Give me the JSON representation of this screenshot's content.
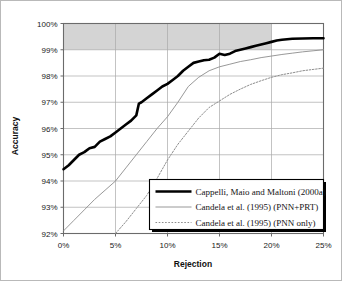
{
  "chart_data": {
    "type": "line",
    "title": "",
    "xlabel": "Rejection",
    "ylabel": "Accuracy",
    "xlim": [
      0,
      25
    ],
    "ylim": [
      92,
      100
    ],
    "grid": true,
    "legend_position": "bottom-right",
    "xticks": [
      "0%",
      "5%",
      "10%",
      "15%",
      "20%",
      "25%"
    ],
    "xtick_values": [
      0,
      5,
      10,
      15,
      20,
      25
    ],
    "yticks": [
      "92%",
      "93%",
      "94%",
      "95%",
      "96%",
      "97%",
      "98%",
      "99%",
      "100%"
    ],
    "ytick_values": [
      92,
      93,
      94,
      95,
      96,
      97,
      98,
      99,
      100
    ],
    "shaded_band": {
      "y_from": 99,
      "y_to": 100,
      "x_from": 0,
      "x_to": 20,
      "color": "#d4d4d4"
    },
    "series": [
      {
        "name": "Cappelli, Maio and Maltoni (2000a)",
        "style": "thick-solid",
        "color": "#000000",
        "x": [
          0,
          0.5,
          1,
          1.5,
          2,
          2.5,
          3,
          3.5,
          4,
          4.5,
          5,
          5.5,
          6,
          6.5,
          7,
          7.25,
          7.5,
          8,
          8.5,
          9,
          9.5,
          10,
          10.5,
          11,
          11.5,
          12,
          12.5,
          13,
          13.5,
          14,
          14.5,
          15,
          15.5,
          16,
          16.5,
          17,
          17.5,
          18,
          18.5,
          19,
          19.5,
          20,
          20.5,
          21,
          21.5,
          22,
          23,
          24,
          25
        ],
        "y": [
          94.45,
          94.6,
          94.8,
          95.0,
          95.1,
          95.25,
          95.3,
          95.5,
          95.6,
          95.7,
          95.85,
          96.0,
          96.15,
          96.3,
          96.5,
          96.95,
          97.0,
          97.15,
          97.3,
          97.45,
          97.6,
          97.7,
          97.85,
          98.0,
          98.2,
          98.35,
          98.5,
          98.55,
          98.6,
          98.62,
          98.7,
          98.85,
          98.8,
          98.85,
          98.95,
          99.0,
          99.05,
          99.1,
          99.15,
          99.2,
          99.25,
          99.3,
          99.35,
          99.38,
          99.4,
          99.42,
          99.43,
          99.44,
          99.44
        ]
      },
      {
        "name": "Candela et al. (1995) (PNN+PRT)",
        "style": "thin-solid",
        "color": "#8c8c8c",
        "x": [
          0,
          1,
          2,
          3,
          4,
          5,
          6,
          7,
          8,
          9,
          10,
          11,
          12,
          13,
          14,
          15,
          16,
          17,
          18,
          19,
          20,
          21,
          22,
          23,
          24,
          25
        ],
        "y": [
          92.1,
          92.5,
          92.9,
          93.3,
          93.65,
          94.0,
          94.5,
          95.0,
          95.5,
          96.0,
          96.45,
          97.0,
          97.6,
          97.95,
          98.2,
          98.35,
          98.45,
          98.55,
          98.62,
          98.7,
          98.76,
          98.82,
          98.87,
          98.92,
          98.96,
          99.0
        ]
      },
      {
        "name": "Candela et al. (1995) (PNN only)",
        "style": "dotted",
        "color": "#8c8c8c",
        "x": [
          5,
          6,
          7,
          8,
          9,
          10,
          11,
          12,
          13,
          14,
          15,
          16,
          17,
          18,
          19,
          20,
          21,
          22,
          23,
          24,
          25
        ],
        "y": [
          92.0,
          92.45,
          92.95,
          93.45,
          94.1,
          94.8,
          95.4,
          95.9,
          96.4,
          96.8,
          97.05,
          97.3,
          97.5,
          97.68,
          97.82,
          97.95,
          98.05,
          98.12,
          98.2,
          98.25,
          98.3
        ]
      }
    ]
  },
  "legend": {
    "items": [
      {
        "label": "Cappelli, Maio and Maltoni (2000a)",
        "style": "thick-solid"
      },
      {
        "label": "Candela et al. (1995) (PNN+PRT)",
        "style": "thin-solid"
      },
      {
        "label": "Candela et al. (1995) (PNN only)",
        "style": "dotted"
      }
    ]
  }
}
